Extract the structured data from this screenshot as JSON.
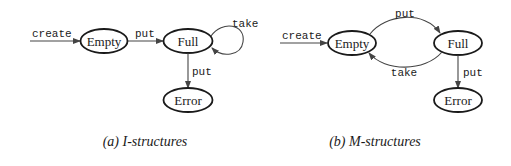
{
  "figure": {
    "panels": [
      {
        "id": "a",
        "caption": "(a) I-structures",
        "states": {
          "empty": "Empty",
          "full": "Full",
          "error": "Error"
        },
        "transitions": {
          "create": "create",
          "empty_to_full": "put",
          "full_self_loop": "take",
          "full_to_error": "put"
        }
      },
      {
        "id": "b",
        "caption": "(b) M-structures",
        "states": {
          "empty": "Empty",
          "full": "Full",
          "error": "Error"
        },
        "transitions": {
          "create": "create",
          "empty_to_full": "put",
          "full_to_empty": "take",
          "full_to_error": "put"
        }
      }
    ],
    "colors": {
      "stroke": "#1a1a1a",
      "edge": "#444444",
      "background": "#ffffff"
    }
  }
}
